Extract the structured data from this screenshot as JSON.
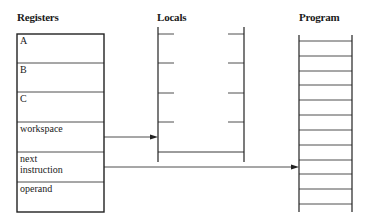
{
  "titles": {
    "registers": "Registers",
    "locals": "Locals",
    "program": "Program"
  },
  "registers": [
    {
      "label": "A"
    },
    {
      "label": "B"
    },
    {
      "label": "C"
    },
    {
      "label": "workspace"
    },
    {
      "label": "next instruction",
      "line1": "next",
      "line2": "instruction"
    },
    {
      "label": "operand"
    }
  ],
  "arrows": [
    {
      "from": "workspace",
      "to": "locals"
    },
    {
      "from": "next instruction",
      "to": "program"
    }
  ],
  "colors": {
    "line": "#222222",
    "background": "#ffffff"
  }
}
